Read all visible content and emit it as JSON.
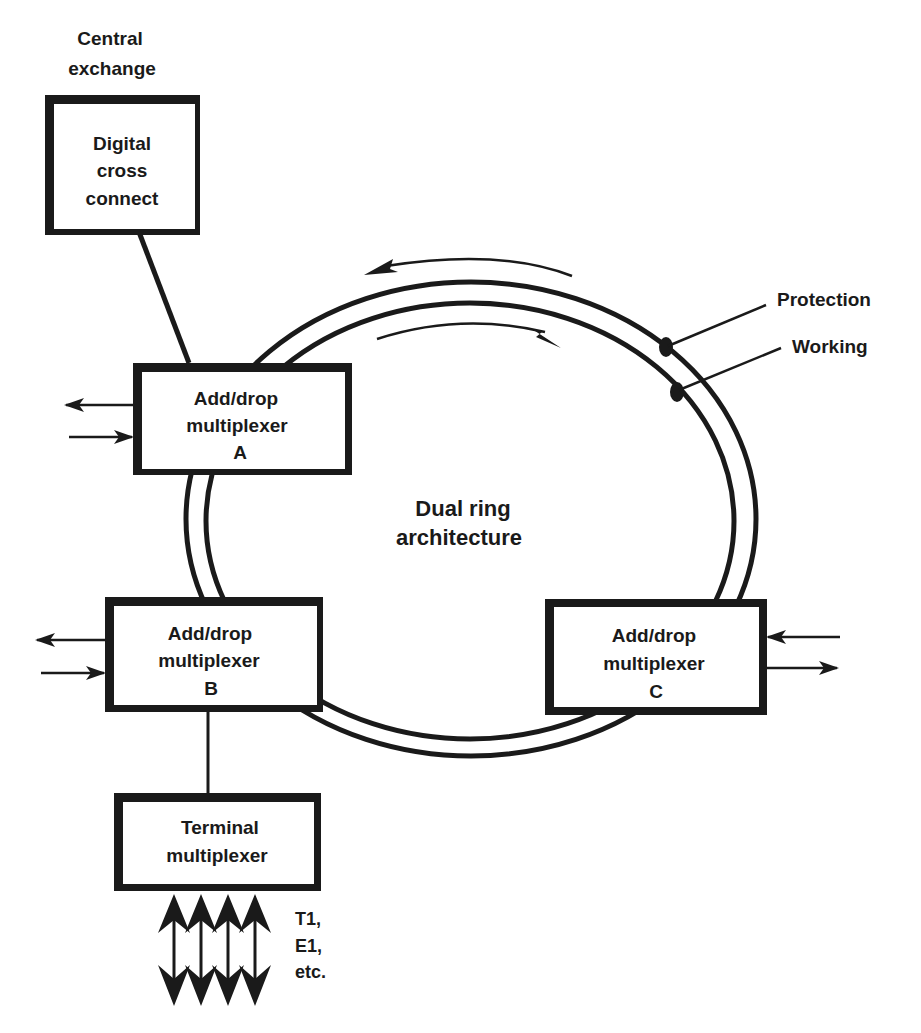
{
  "title": "Dual ring architecture",
  "central_exchange": {
    "caption_line1": "Central",
    "caption_line2": "exchange",
    "box_line1": "Digital",
    "box_line2": "cross",
    "box_line3": "connect"
  },
  "adm_a": {
    "line1": "Add/drop",
    "line2": "multiplexer",
    "line3": "A"
  },
  "adm_b": {
    "line1": "Add/drop",
    "line2": "multiplexer",
    "line3": "B"
  },
  "adm_c": {
    "line1": "Add/drop",
    "line2": "multiplexer",
    "line3": "C"
  },
  "terminal_mux": {
    "line1": "Terminal",
    "line2": "multiplexer"
  },
  "tributaries": {
    "line1": "T1,",
    "line2": "E1,",
    "line3": "etc."
  },
  "ring_labels": {
    "protection": "Protection",
    "working": "Working"
  },
  "center_label": {
    "line1": "Dual ring",
    "line2": "architecture"
  },
  "colors": {
    "ink": "#1a1a1a",
    "background": "#ffffff"
  }
}
